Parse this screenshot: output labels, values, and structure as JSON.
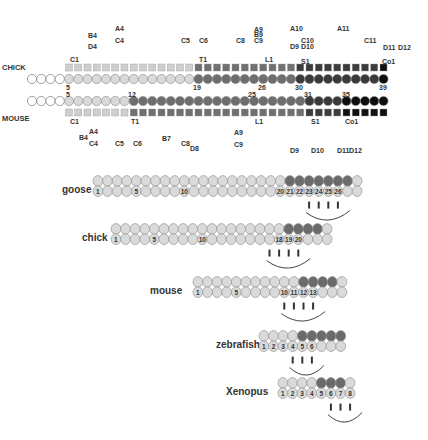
{
  "colors": {
    "white": "#ffffff",
    "light": "#d9d9d9",
    "medium": "#6e6e6e",
    "dark": "#3a3a3a",
    "black": "#0e0e0e",
    "outline": "#888888",
    "sq_light": "#cfcfcf",
    "sq_medium": "#707070",
    "sq_dark": "#3c3c3c",
    "sq_black": "#111111"
  },
  "top_panel": {
    "chick": {
      "label": "CHICK",
      "total_vertebrae": 39,
      "segments": [
        {
          "from": 1,
          "to": 4,
          "shade": "white"
        },
        {
          "from": 5,
          "to": 18,
          "shade": "light"
        },
        {
          "from": 19,
          "to": 29,
          "shade": "medium"
        },
        {
          "from": 30,
          "to": 38,
          "shade": "dark"
        },
        {
          "from": 39,
          "to": 39,
          "shade": "black"
        }
      ],
      "number_marks": [
        "5",
        "19",
        "26",
        "30",
        "39"
      ],
      "region_labels": [
        "C1",
        "T1",
        "L1",
        "S1",
        "Co1"
      ],
      "hox_labels": [
        "B4",
        "D4",
        "A4",
        "C4",
        "C5",
        "C6",
        "C8",
        "A9",
        "B9",
        "C9",
        "A10",
        "C10",
        "D9",
        "D10",
        "A11",
        "C11",
        "D11",
        "D12"
      ]
    },
    "mouse": {
      "label": "MOUSE",
      "total_vertebrae": 39,
      "segments": [
        {
          "from": 1,
          "to": 4,
          "shade": "white"
        },
        {
          "from": 5,
          "to": 11,
          "shade": "light"
        },
        {
          "from": 12,
          "to": 30,
          "shade": "medium"
        },
        {
          "from": 31,
          "to": 34,
          "shade": "dark"
        },
        {
          "from": 35,
          "to": 39,
          "shade": "black"
        }
      ],
      "number_marks": [
        "5",
        "12",
        "25",
        "31",
        "35"
      ],
      "region_labels": [
        "C1",
        "T1",
        "L1",
        "S1",
        "Co1"
      ],
      "hox_labels": [
        "A4",
        "B4",
        "C4",
        "C5",
        "C6",
        "B7",
        "C8",
        "D8",
        "A9",
        "C9",
        "D9",
        "D10",
        "D11",
        "D12"
      ]
    }
  },
  "bottom_panel": [
    {
      "species": "goose",
      "total": 28,
      "dark_from": 21,
      "dark_to": 27,
      "numbers": [
        "1",
        "5",
        "10",
        "20",
        "21",
        "22",
        "23",
        "24",
        "25",
        "26"
      ],
      "numbered_positions": [
        1,
        5,
        10,
        20,
        21,
        22,
        23,
        24,
        25,
        26
      ],
      "ticks": 4
    },
    {
      "species": "chick",
      "total": 23,
      "dark_from": 19,
      "dark_to": 22,
      "numbers": [
        "1",
        "5",
        "10",
        "18",
        "19",
        "20"
      ],
      "numbered_positions": [
        1,
        5,
        10,
        18,
        19,
        20
      ],
      "ticks": 4
    },
    {
      "species": "mouse",
      "total": 16,
      "dark_from": 12,
      "dark_to": 15,
      "numbers": [
        "1",
        "5",
        "10",
        "11",
        "12",
        "13"
      ],
      "numbered_positions": [
        1,
        5,
        10,
        11,
        12,
        13
      ],
      "ticks": 4
    },
    {
      "species": "zebrafish",
      "total": 9,
      "dark_from": 5,
      "dark_to": 9,
      "numbers": [
        "1",
        "2",
        "3",
        "4",
        "5",
        "6"
      ],
      "numbered_positions": [
        1,
        2,
        3,
        4,
        5,
        6
      ],
      "ticks": 3
    },
    {
      "species": "Xenopus",
      "total": 8,
      "dark_from": 5,
      "dark_to": 7,
      "numbers": [
        "1",
        "2",
        "3",
        "4",
        "5",
        "6",
        "7",
        "8"
      ],
      "numbered_positions": [
        1,
        2,
        3,
        4,
        5,
        6,
        7,
        8
      ],
      "ticks": 3
    }
  ]
}
